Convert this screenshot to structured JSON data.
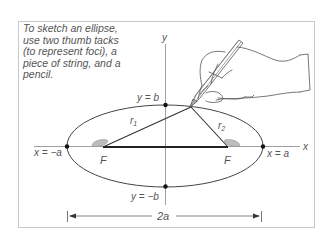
{
  "caption": {
    "lines": [
      "To sketch an ellipse,",
      "use two thumb tacks",
      "(to represent foci), a",
      "piece of string, and a",
      "pencil."
    ]
  },
  "axes": {
    "x_label": "x",
    "y_label": "y"
  },
  "labels": {
    "top_vertex": "y = b",
    "bottom_vertex": "y = −b",
    "left_vertex": "x = −a",
    "right_vertex": "x = a",
    "focus_left": "F",
    "focus_right": "F",
    "r1": "r",
    "r1_sub": "1",
    "r2": "r",
    "r2_sub": "2",
    "major_axis": "2a"
  },
  "colors": {
    "line": "#333333",
    "frame": "#cccccc",
    "tack": "#bbbbbb",
    "text": "#555555"
  }
}
